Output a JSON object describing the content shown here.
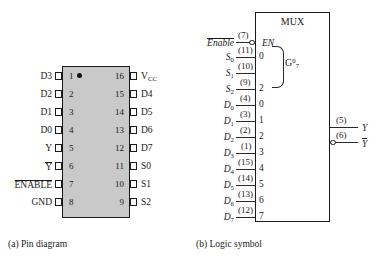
{
  "figure": {
    "part_a": {
      "caption": "(a)  Pin diagram",
      "pin1_marker": "pin-1-dot",
      "left_pins": [
        {
          "num": "1",
          "name": "D3"
        },
        {
          "num": "2",
          "name": "D2"
        },
        {
          "num": "3",
          "name": "D1"
        },
        {
          "num": "4",
          "name": "D0"
        },
        {
          "num": "5",
          "name": "Y"
        },
        {
          "num": "6",
          "name": "Y",
          "overbar": true
        },
        {
          "num": "7",
          "name": "ENABLE",
          "overbar": true
        },
        {
          "num": "8",
          "name": "GND"
        }
      ],
      "right_pins": [
        {
          "num": "16",
          "name": "V",
          "sub": "CC"
        },
        {
          "num": "15",
          "name": "D4"
        },
        {
          "num": "14",
          "name": "D5"
        },
        {
          "num": "13",
          "name": "D6"
        },
        {
          "num": "12",
          "name": "D7"
        },
        {
          "num": "11",
          "name": "S0"
        },
        {
          "num": "10",
          "name": "S1"
        },
        {
          "num": "9",
          "name": "S2"
        }
      ]
    },
    "part_b": {
      "caption": "(b)  Logic symbol",
      "box_title": "MUX",
      "enable": {
        "name": "Enable",
        "overbar": true,
        "pin": "(7)",
        "port": "EN",
        "inverted": true
      },
      "select_group_label_base": "G",
      "select_group_label_sup": "0",
      "select_group_label_sub": "7",
      "select_inputs": [
        {
          "name": "S",
          "sub": "0",
          "pin": "(11)",
          "idx": "0"
        },
        {
          "name": "S",
          "sub": "1",
          "pin": "(10)",
          "idx": ""
        },
        {
          "name": "S",
          "sub": "2",
          "pin": "(9)",
          "idx": "2"
        }
      ],
      "data_inputs": [
        {
          "name": "D",
          "sub": "0",
          "pin": "(4)",
          "idx": "0"
        },
        {
          "name": "D",
          "sub": "1",
          "pin": "(3)",
          "idx": "1"
        },
        {
          "name": "D",
          "sub": "2",
          "pin": "(2)",
          "idx": "2"
        },
        {
          "name": "D",
          "sub": "3",
          "pin": "(1)",
          "idx": "3"
        },
        {
          "name": "D",
          "sub": "4",
          "pin": "(15)",
          "idx": "4"
        },
        {
          "name": "D",
          "sub": "5",
          "pin": "(14)",
          "idx": "5"
        },
        {
          "name": "D",
          "sub": "6",
          "pin": "(13)",
          "idx": "6"
        },
        {
          "name": "D",
          "sub": "7",
          "pin": "(12)",
          "idx": "7"
        }
      ],
      "outputs": [
        {
          "name": "Y",
          "pin": "(5)",
          "overbar": false,
          "inverted": false
        },
        {
          "name": "Y",
          "pin": "(6)",
          "overbar": true,
          "inverted": true
        }
      ]
    }
  },
  "colors": {
    "package_fill": "#c9c9c9",
    "ink": "#1a1a1a",
    "background": "#ffffff"
  }
}
